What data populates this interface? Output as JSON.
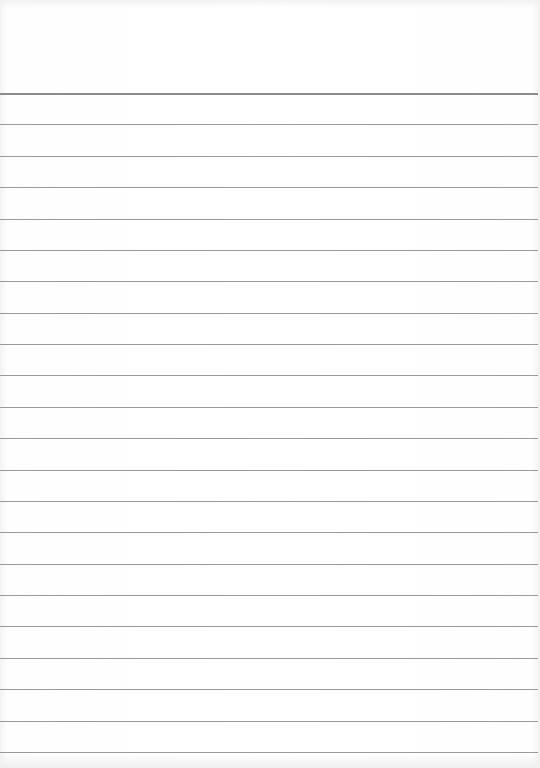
{
  "paper": {
    "type": "lined notebook page",
    "line_count": 22,
    "line_color": "#9a9a9a",
    "background_color": "#ffffff",
    "text": ""
  }
}
